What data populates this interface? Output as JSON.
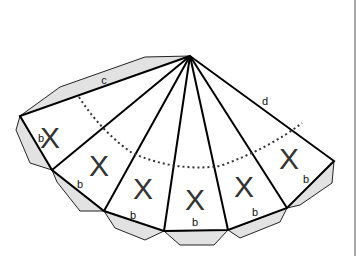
{
  "diagram": {
    "type": "cone net (fan of triangles with glue tabs)",
    "apex": [
      190,
      56
    ],
    "outline_vertices": [
      [
        20,
        116
      ],
      [
        52,
        170
      ],
      [
        104,
        211
      ],
      [
        164,
        231
      ],
      [
        228,
        230
      ],
      [
        287,
        208
      ],
      [
        334,
        161
      ]
    ],
    "faces": [
      {
        "label": "X",
        "pos": [
          39,
          140
        ]
      },
      {
        "label": "X",
        "pos": [
          97,
          175
        ]
      },
      {
        "label": "X",
        "pos": [
          143,
          198
        ]
      },
      {
        "label": "X",
        "pos": [
          195,
          209
        ]
      },
      {
        "label": "X",
        "pos": [
          246,
          197
        ]
      },
      {
        "label": "X",
        "pos": [
          289,
          168
        ]
      }
    ],
    "edge_labels": [
      {
        "text": "c",
        "pos": [
          103,
          82
        ]
      },
      {
        "text": "d",
        "pos": [
          265,
          104
        ]
      },
      {
        "text": "b",
        "pos": [
          41,
          142
        ]
      },
      {
        "text": "b",
        "pos": [
          80,
          188
        ]
      },
      {
        "text": "b",
        "pos": [
          133,
          218
        ]
      },
      {
        "text": "b",
        "pos": [
          195,
          225
        ]
      },
      {
        "text": "b",
        "pos": [
          255,
          216
        ]
      },
      {
        "text": "b",
        "pos": [
          306,
          182
        ]
      }
    ],
    "colors": {
      "line": "#000000",
      "tab_fill": "#e2e2e2",
      "background": "#ffffff",
      "border": "#888888"
    }
  }
}
